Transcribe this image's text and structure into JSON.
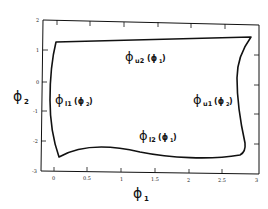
{
  "figure": {
    "x_axis": {
      "label_symbol": "ϕ",
      "label_sub": "1",
      "ticks": [
        "0",
        "0.5",
        "1",
        "1.5",
        "2",
        "2.5",
        "3"
      ]
    },
    "y_axis": {
      "label_symbol": "ϕ",
      "label_sub": "2",
      "ticks": [
        "2",
        "1",
        "0",
        "-1",
        "-2",
        "-3"
      ]
    },
    "boundary_labels": {
      "upper2": {
        "symbol": "ϕ",
        "sub": "u2",
        "arg": "(ϕ",
        "arg_sub": "1",
        "close": ")"
      },
      "lower1": {
        "symbol": "ϕ",
        "sub": "l1",
        "arg": "(ϕ",
        "arg_sub": "2",
        "close": ")"
      },
      "upper1": {
        "symbol": "ϕ",
        "sub": "u1",
        "arg": "(ϕ",
        "arg_sub": "2",
        "close": ")"
      },
      "lower2": {
        "symbol": "ϕ",
        "sub": "l2",
        "arg": "(ϕ",
        "arg_sub": "1",
        "close": ")"
      }
    },
    "colors": {
      "ink": "#111111",
      "background": "#ffffff"
    }
  }
}
